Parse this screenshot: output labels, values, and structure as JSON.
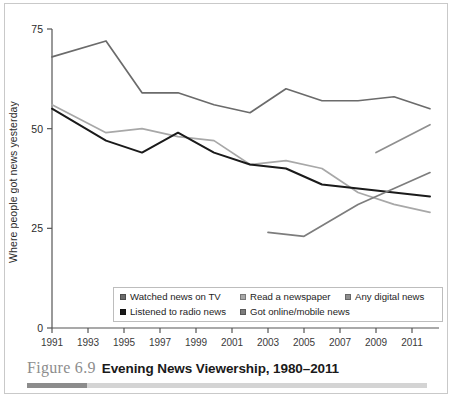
{
  "caption": {
    "figure_number": "Figure 6.9",
    "title": "Evening News Viewership, 1980–2011"
  },
  "axes": {
    "ylabel": "Where people got news yesterday",
    "yticks": [
      "0",
      "25",
      "50",
      "75"
    ],
    "ytick_values": [
      0,
      25,
      50,
      75
    ],
    "xticks": [
      "1991",
      "1993",
      "1995",
      "1997",
      "1999",
      "2001",
      "2003",
      "2005",
      "2007",
      "2009",
      "2011"
    ],
    "ylim": [
      0,
      75
    ],
    "xlim": [
      1991,
      2012
    ]
  },
  "legend": {
    "position": "inside-bottom",
    "rows": [
      [
        {
          "label": "Watched news on TV",
          "color": "#6b6b6b"
        },
        {
          "label": "Read a newspaper",
          "color": "#a8a8a8"
        },
        {
          "label": "Any digital news",
          "color": "#8f8f8f"
        }
      ],
      [
        {
          "label": "Listened to radio news",
          "color": "#1a1a1a"
        },
        {
          "label": "Got online/mobile news",
          "color": "#7d7d7d"
        }
      ]
    ]
  },
  "colors": {
    "tv": "#6b6b6b",
    "newspaper": "#a8a8a8",
    "digital": "#8f8f8f",
    "radio": "#1a1a1a",
    "online": "#7d7d7d",
    "axis": "#555555",
    "frame": "#c9c9c9",
    "caption_rule_dark": "#8c8c8c",
    "caption_rule_light": "#d4d4d4"
  },
  "chart_data": {
    "type": "line",
    "title": "Evening News Viewership, 1980–2011",
    "xlabel": "",
    "ylabel": "Where people got news yesterday",
    "ylim": [
      0,
      75
    ],
    "xlim": [
      1991,
      2012
    ],
    "yticks": [
      0,
      25,
      50,
      75
    ],
    "xticks": [
      1991,
      1993,
      1995,
      1997,
      1999,
      2001,
      2003,
      2005,
      2007,
      2009,
      2011
    ],
    "grid": false,
    "legend_position": "inside-bottom",
    "series": [
      {
        "name": "Watched news on TV",
        "color": "#6b6b6b",
        "x": [
          1991,
          1994,
          1996,
          1998,
          2000,
          2002,
          2004,
          2006,
          2008,
          2010,
          2012
        ],
        "values": [
          68,
          72,
          59,
          59,
          56,
          54,
          60,
          57,
          57,
          58,
          55
        ]
      },
      {
        "name": "Read a newspaper",
        "color": "#a8a8a8",
        "x": [
          1991,
          1994,
          1996,
          1998,
          2000,
          2002,
          2004,
          2006,
          2008,
          2010,
          2012
        ],
        "values": [
          56,
          49,
          50,
          48,
          47,
          41,
          42,
          40,
          34,
          31,
          29
        ]
      },
      {
        "name": "Listened to radio news",
        "color": "#1a1a1a",
        "x": [
          1991,
          1994,
          1996,
          1998,
          2000,
          2002,
          2004,
          2006,
          2008,
          2010,
          2012
        ],
        "values": [
          55,
          47,
          44,
          49,
          44,
          41,
          40,
          36,
          35,
          34,
          33
        ]
      },
      {
        "name": "Got online/mobile news",
        "color": "#7d7d7d",
        "x": [
          2003,
          2005,
          2008,
          2010,
          2012
        ],
        "values": [
          24,
          23,
          31,
          35,
          39
        ]
      },
      {
        "name": "Any digital news",
        "color": "#8f8f8f",
        "x": [
          2009,
          2012
        ],
        "values": [
          44,
          51
        ]
      }
    ]
  }
}
